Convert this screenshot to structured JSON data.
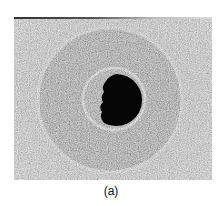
{
  "figure": {
    "label": "(a)",
    "colors": {
      "background_texture": "#c9c9c9",
      "outer_disk": "#9a9a9a",
      "halo_ring": "#d8d8d8",
      "inner_ring": "#e4e4e4",
      "core": "#050505"
    }
  }
}
